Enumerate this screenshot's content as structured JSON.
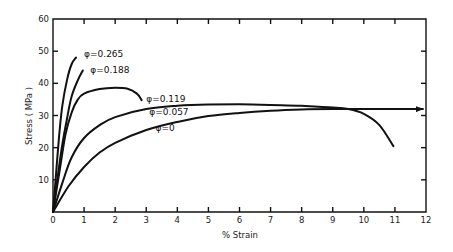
{
  "chart_data": {
    "type": "line",
    "title": "",
    "xlabel": "% Strain",
    "ylabel": "Stress ( MPa )",
    "xlim": [
      0,
      12
    ],
    "ylim": [
      0,
      60
    ],
    "xticks": [
      0,
      1,
      2,
      3,
      4,
      5,
      6,
      7,
      8,
      9,
      10,
      11,
      12
    ],
    "yticks": [
      10,
      20,
      30,
      40,
      50,
      60
    ],
    "grid": false,
    "legend": "inline labels next to curves",
    "series": [
      {
        "name": "φ=0.265",
        "x": [
          0,
          0.1,
          0.2,
          0.3,
          0.45,
          0.6,
          0.74
        ],
        "y": [
          0,
          12,
          24,
          33,
          41,
          46,
          48
        ],
        "label_pos": [
          1.0,
          49
        ]
      },
      {
        "name": "φ=0.188",
        "x": [
          0,
          0.15,
          0.3,
          0.45,
          0.6,
          0.8,
          0.96
        ],
        "y": [
          0,
          11,
          21,
          29,
          36,
          41,
          44
        ],
        "label_pos": [
          1.2,
          44
        ]
      },
      {
        "name": "φ=0.119",
        "x": [
          0,
          0.2,
          0.4,
          0.6,
          0.8,
          1.0,
          1.5,
          2.0,
          2.4,
          2.7,
          2.85
        ],
        "y": [
          0,
          12,
          24,
          31,
          35,
          36.8,
          38.2,
          38.6,
          38.3,
          36.8,
          34.8
        ],
        "label_pos": [
          3.0,
          35
        ]
      },
      {
        "name": "φ=0.057",
        "x": [
          0,
          0.3,
          0.6,
          1.0,
          1.5,
          2.0,
          3.0,
          4.0,
          5.0,
          6.0,
          7.0,
          8.0,
          9.0,
          9.5,
          10.0,
          10.5,
          10.95
        ],
        "y": [
          0,
          9,
          17,
          23,
          27,
          29.5,
          32,
          33,
          33.4,
          33.5,
          33.3,
          33,
          32.5,
          32,
          30.5,
          27,
          20.5
        ],
        "label_pos": [
          3.1,
          31
        ]
      },
      {
        "name": "φ=0",
        "x": [
          0,
          0.5,
          1.0,
          1.5,
          2.0,
          3.0,
          4.0,
          5.0,
          6.0,
          7.0,
          8.0,
          9.0,
          10.0,
          11.0,
          11.9
        ],
        "y": [
          0,
          8,
          14,
          18.5,
          21.5,
          25.5,
          28,
          29.8,
          30.8,
          31.5,
          31.9,
          32,
          32,
          32,
          32
        ],
        "label_pos": [
          3.3,
          26
        ],
        "continues_arrow": true
      }
    ]
  }
}
